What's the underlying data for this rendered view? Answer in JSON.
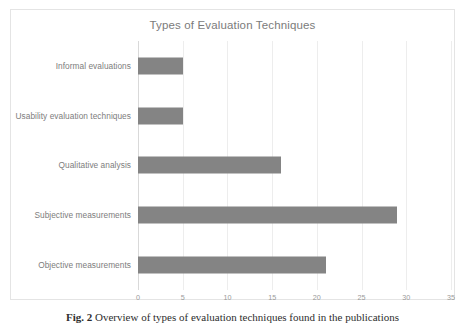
{
  "figure": {
    "caption_number": "Fig. 2",
    "caption_text": "Overview of types of evaluation techniques found in the publications"
  },
  "chart_data": {
    "type": "bar",
    "orientation": "horizontal",
    "title": "Types of Evaluation Techniques",
    "xlabel": "",
    "ylabel": "",
    "categories": [
      "Informal evaluations",
      "Usability evaluation techniques",
      "Qualitative analysis",
      "Subjective measurements",
      "Objective measurements"
    ],
    "values": [
      5,
      5,
      16,
      29,
      21
    ],
    "xlim": [
      0,
      35
    ],
    "xticks": [
      0,
      5,
      10,
      15,
      20,
      25,
      30,
      35
    ],
    "xtick_labels": [
      "0",
      "5",
      "10",
      "15",
      "20",
      "25",
      "30",
      "35"
    ],
    "grid": "vertical",
    "legend": "none",
    "bar_color": "#848484",
    "gridline_color": "#ededed",
    "title_color": "#7b7b7b",
    "label_color": "#7d7d7d"
  }
}
